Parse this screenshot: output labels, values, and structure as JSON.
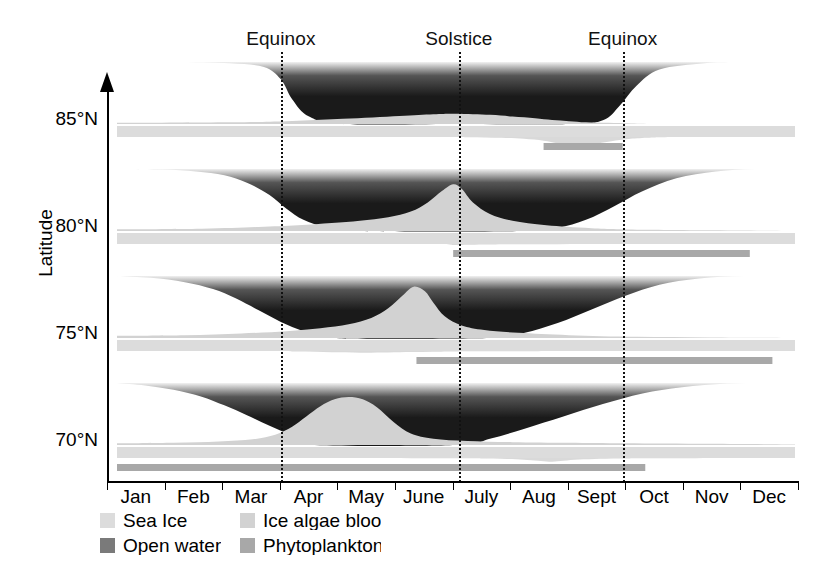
{
  "figure": {
    "y_axis_title": "Latitude",
    "latitude_ticks": [
      "85°N",
      "80°N",
      "75°N",
      "70°N"
    ],
    "months": [
      "Jan",
      "Feb",
      "Mar",
      "Apr",
      "May",
      "June",
      "July",
      "Aug",
      "Sept",
      "Oct",
      "Nov",
      "Dec"
    ],
    "event_labels": [
      "Equinox",
      "Solstice",
      "Equinox"
    ]
  },
  "legend": {
    "items": [
      {
        "label": "Sea Ice",
        "color": "#dcdcdc"
      },
      {
        "label": "Ice algae bloom",
        "color": "#d2d2d2"
      },
      {
        "label": "Open water",
        "color": "#7a7a7a"
      },
      {
        "label": "Phytoplankton bloom",
        "color": "#a8a8a8"
      }
    ]
  },
  "colors": {
    "open_water_dark": "#1a1a1a",
    "open_water_mid": "#555555",
    "sea_ice": "#dcdcdc",
    "ice_algae": "#d2d2d2",
    "phytoplankton": "#a8a8a8",
    "axis": "#000000",
    "background": "#ffffff"
  },
  "chart_data": {
    "type": "area",
    "title": "",
    "xlabel": "",
    "ylabel": "Latitude",
    "x_categories": [
      "Jan",
      "Feb",
      "Mar",
      "Apr",
      "May",
      "June",
      "July",
      "Aug",
      "Sept",
      "Oct",
      "Nov",
      "Dec"
    ],
    "x_range_months": [
      0,
      12
    ],
    "grid": false,
    "legend_position": "bottom-left",
    "annotations": [
      {
        "label": "Equinox",
        "month_value": 2.9
      },
      {
        "label": "Solstice",
        "month_value": 6.05
      },
      {
        "label": "Equinox",
        "month_value": 8.95
      }
    ],
    "panels": [
      {
        "latitude": "85°N",
        "open_water_fraction": {
          "x": [
            0,
            1,
            2,
            2.6,
            2.9,
            3.1,
            3.4,
            4,
            6,
            8,
            8.6,
            8.9,
            9.2,
            9.6,
            10.4,
            11,
            12
          ],
          "y": [
            1.0,
            1.0,
            0.98,
            0.92,
            0.72,
            0.4,
            0.12,
            0.0,
            0.0,
            0.0,
            0.06,
            0.3,
            0.62,
            0.88,
            0.98,
            1.0,
            1.0
          ]
        },
        "ice_algae_bloom": {
          "x": [
            0,
            2,
            3,
            4,
            5,
            5.6,
            6,
            6.6,
            7,
            7.4,
            7.7,
            8.0,
            8.3,
            8.7,
            9.1,
            9.6,
            10.5,
            12
          ],
          "y": [
            0.02,
            0.03,
            0.05,
            0.09,
            0.14,
            0.17,
            0.18,
            0.16,
            0.13,
            0.1,
            0.07,
            0.05,
            0.03,
            0.02,
            0.01,
            0.0,
            0.0,
            0.0
          ],
          "peak_month": 6.0,
          "peak_value": 0.18
        },
        "phytoplankton_bloom": {
          "x": [
            0,
            5.5,
            6.2,
            6.8,
            7.2,
            7.55,
            7.8,
            8.05,
            8.4,
            8.75,
            9.05,
            9.4,
            10,
            12
          ],
          "y": [
            0.0,
            0.0,
            0.02,
            0.06,
            0.13,
            0.26,
            0.45,
            0.62,
            0.52,
            0.3,
            0.14,
            0.05,
            0.0,
            0.0
          ],
          "peak_month": 8.05,
          "peak_value": 0.62
        },
        "phytoplankton_bar": {
          "start_month": 7.55,
          "end_month": 8.95
        },
        "sea_ice_bar": {
          "start_month": 0,
          "end_month": 12
        }
      },
      {
        "latitude": "80°N",
        "open_water_fraction": {
          "x": [
            0,
            0.8,
            1.4,
            1.9,
            2.3,
            2.7,
            3.0,
            3.3,
            3.7,
            4.2,
            7.2,
            7.8,
            8.3,
            8.8,
            9.3,
            9.9,
            10.6,
            11.3,
            12
          ],
          "y": [
            1.0,
            0.99,
            0.96,
            0.9,
            0.78,
            0.58,
            0.36,
            0.18,
            0.06,
            0.0,
            0.0,
            0.05,
            0.18,
            0.4,
            0.64,
            0.85,
            0.96,
            1.0,
            1.0
          ]
        },
        "ice_algae_bloom": {
          "x": [
            0,
            1.5,
            2.5,
            3.2,
            3.8,
            4.3,
            4.8,
            5.2,
            5.5,
            5.75,
            5.95,
            6.1,
            6.3,
            6.6,
            7.0,
            7.6,
            8.4,
            9.5,
            12
          ],
          "y": [
            0.03,
            0.04,
            0.07,
            0.1,
            0.14,
            0.18,
            0.24,
            0.34,
            0.5,
            0.7,
            0.82,
            0.74,
            0.5,
            0.3,
            0.18,
            0.1,
            0.05,
            0.02,
            0.0
          ],
          "peak_month": 5.95,
          "peak_value": 0.82
        },
        "phytoplankton_bloom": {
          "x": [
            0,
            5.4,
            5.8,
            6.0,
            6.2,
            6.5,
            7.0,
            7.8,
            8.8,
            10,
            12
          ],
          "y": [
            0.0,
            0.0,
            0.03,
            0.08,
            0.06,
            0.04,
            0.02,
            0.01,
            0.0,
            0.0,
            0.0
          ],
          "peak_month": 6.05,
          "peak_value": 0.08
        },
        "phytoplankton_bar": {
          "start_month": 5.95,
          "end_month": 11.2
        },
        "sea_ice_bar": {
          "start_month": 0,
          "end_month": 12
        }
      },
      {
        "latitude": "75°N",
        "open_water_fraction": {
          "x": [
            0,
            0.6,
            1.2,
            1.7,
            2.1,
            2.5,
            2.9,
            3.3,
            3.7,
            6.6,
            7.2,
            7.8,
            8.4,
            9.0,
            9.6,
            10.3,
            11.1,
            12
          ],
          "y": [
            1.0,
            0.97,
            0.9,
            0.79,
            0.64,
            0.45,
            0.26,
            0.11,
            0.0,
            0.0,
            0.08,
            0.24,
            0.46,
            0.68,
            0.86,
            0.96,
            1.0,
            1.0
          ]
        },
        "ice_algae_bloom": {
          "x": [
            0,
            1.2,
            2.2,
            3.0,
            3.6,
            4.1,
            4.5,
            4.8,
            5.05,
            5.25,
            5.45,
            5.6,
            5.8,
            6.1,
            6.5,
            7.1,
            8.0,
            9.2,
            10.5,
            12
          ],
          "y": [
            0.04,
            0.05,
            0.08,
            0.12,
            0.17,
            0.24,
            0.35,
            0.52,
            0.74,
            0.9,
            0.82,
            0.62,
            0.38,
            0.22,
            0.14,
            0.09,
            0.05,
            0.02,
            0.01,
            0.0
          ],
          "peak_month": 5.25,
          "peak_value": 0.9
        },
        "phytoplankton_bloom": {
          "x": [
            0,
            2.6,
            3.2,
            3.8,
            4.3,
            4.8,
            5.2,
            5.6,
            6.0,
            6.6,
            7.4,
            8.5,
            12
          ],
          "y": [
            0.0,
            0.0,
            0.04,
            0.09,
            0.12,
            0.11,
            0.08,
            0.05,
            0.03,
            0.02,
            0.01,
            0.0,
            0.0
          ],
          "peak_month": 4.3,
          "peak_value": 0.12
        },
        "phytoplankton_bar": {
          "start_month": 5.3,
          "end_month": 11.6
        },
        "sea_ice_bar": {
          "start_month": 0,
          "end_month": 12
        }
      },
      {
        "latitude": "70°N",
        "open_water_fraction": {
          "x": [
            0,
            0.5,
            1.0,
            1.5,
            1.9,
            2.3,
            2.7,
            3.1,
            3.5,
            6.0,
            6.6,
            7.2,
            7.9,
            8.6,
            9.3,
            10.0,
            10.8,
            11.6,
            12
          ],
          "y": [
            1.0,
            0.96,
            0.89,
            0.78,
            0.64,
            0.48,
            0.31,
            0.15,
            0.0,
            0.0,
            0.1,
            0.26,
            0.46,
            0.66,
            0.83,
            0.93,
            0.99,
            1.0,
            1.0
          ]
        },
        "ice_algae_bloom": {
          "x": [
            0,
            1.0,
            1.8,
            2.4,
            2.8,
            3.1,
            3.35,
            3.6,
            3.85,
            4.1,
            4.35,
            4.6,
            4.9,
            5.2,
            5.6,
            6.2,
            7.0,
            8.0,
            9.0,
            10.5,
            12
          ],
          "y": [
            0.03,
            0.04,
            0.06,
            0.1,
            0.18,
            0.32,
            0.5,
            0.68,
            0.8,
            0.84,
            0.8,
            0.66,
            0.4,
            0.2,
            0.11,
            0.07,
            0.05,
            0.04,
            0.03,
            0.02,
            0.01
          ],
          "peak_month": 4.1,
          "peak_value": 0.84
        },
        "phytoplankton_bloom": {
          "x": [
            0,
            5.8,
            6.4,
            6.9,
            7.2,
            7.45,
            7.65,
            7.85,
            8.1,
            8.45,
            8.9,
            9.5,
            12
          ],
          "y": [
            0.0,
            0.02,
            0.04,
            0.07,
            0.12,
            0.2,
            0.27,
            0.22,
            0.13,
            0.07,
            0.04,
            0.02,
            0.0
          ],
          "peak_month": 7.65,
          "peak_value": 0.27
        },
        "phytoplankton_bar": {
          "start_month": 0,
          "end_month": 9.35
        },
        "sea_ice_bar": {
          "start_month": 0,
          "end_month": 12
        }
      }
    ]
  }
}
